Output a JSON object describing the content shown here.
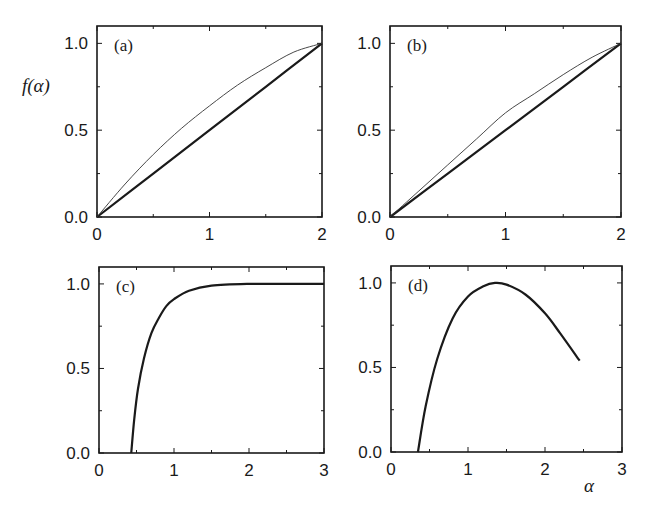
{
  "figure": {
    "ylabel": "f(α)",
    "xlabel": "α"
  },
  "chart_data": [
    {
      "type": "line",
      "panel": "(a)",
      "xlim": [
        0,
        2
      ],
      "ylim": [
        0,
        1.1
      ],
      "xticks": [
        "0",
        "1",
        "2"
      ],
      "yticks": [
        "0.0",
        "0.5",
        "1.0"
      ],
      "ylabel": "f(α)",
      "xlabel": "",
      "grid": false,
      "series": [
        {
          "name": "thick-line",
          "style": "thick",
          "x": [
            0,
            0.5,
            1.0,
            1.5,
            2.0
          ],
          "values": [
            0,
            0.25,
            0.5,
            0.75,
            1.0
          ]
        },
        {
          "name": "thin-curve",
          "style": "thin",
          "x": [
            0,
            0.25,
            0.5,
            0.75,
            1.0,
            1.25,
            1.5,
            1.75,
            2.0
          ],
          "values": [
            0,
            0.19,
            0.36,
            0.51,
            0.64,
            0.76,
            0.86,
            0.95,
            1.0
          ]
        }
      ]
    },
    {
      "type": "line",
      "panel": "(b)",
      "xlim": [
        0,
        2
      ],
      "ylim": [
        0,
        1.1
      ],
      "xticks": [
        "0",
        "1",
        "2"
      ],
      "yticks": [
        "0.0",
        "0.5",
        "1.0"
      ],
      "xlabel": "",
      "ylabel": "",
      "grid": false,
      "series": [
        {
          "name": "thick-line",
          "style": "thick",
          "x": [
            0,
            0.5,
            1.0,
            1.5,
            2.0
          ],
          "values": [
            0,
            0.25,
            0.5,
            0.75,
            1.0
          ]
        },
        {
          "name": "thin-curve",
          "style": "thin",
          "x": [
            0,
            0.25,
            0.5,
            0.75,
            1.0,
            1.25,
            1.5,
            1.75,
            2.0
          ],
          "values": [
            0,
            0.15,
            0.3,
            0.45,
            0.6,
            0.71,
            0.82,
            0.92,
            1.0
          ]
        }
      ]
    },
    {
      "type": "line",
      "panel": "(c)",
      "xlim": [
        0,
        3
      ],
      "ylim": [
        0,
        1.1
      ],
      "xticks": [
        "0",
        "1",
        "2",
        "3"
      ],
      "yticks": [
        "0.0",
        "0.5",
        "1.0"
      ],
      "xlabel": "",
      "ylabel": "",
      "grid": false,
      "series": [
        {
          "name": "curve",
          "style": "thick",
          "x": [
            0.43,
            0.47,
            0.52,
            0.6,
            0.7,
            0.8,
            0.9,
            1.0,
            1.2,
            1.5,
            2.0,
            2.5,
            3.0
          ],
          "values": [
            0,
            0.2,
            0.38,
            0.56,
            0.71,
            0.8,
            0.87,
            0.91,
            0.96,
            0.99,
            1.0,
            1.0,
            1.0
          ]
        }
      ]
    },
    {
      "type": "line",
      "panel": "(d)",
      "xlim": [
        0,
        3
      ],
      "ylim": [
        0,
        1.1
      ],
      "xticks": [
        "0",
        "1",
        "2",
        "3"
      ],
      "yticks": [
        "0.0",
        "0.5",
        "1.0"
      ],
      "xlabel": "α",
      "ylabel": "",
      "grid": false,
      "series": [
        {
          "name": "curve",
          "style": "thick",
          "x": [
            0.35,
            0.45,
            0.6,
            0.8,
            1.0,
            1.2,
            1.35,
            1.5,
            1.75,
            2.0,
            2.2,
            2.45
          ],
          "values": [
            0,
            0.27,
            0.55,
            0.79,
            0.92,
            0.98,
            1.0,
            0.99,
            0.93,
            0.82,
            0.7,
            0.54
          ]
        }
      ]
    }
  ]
}
